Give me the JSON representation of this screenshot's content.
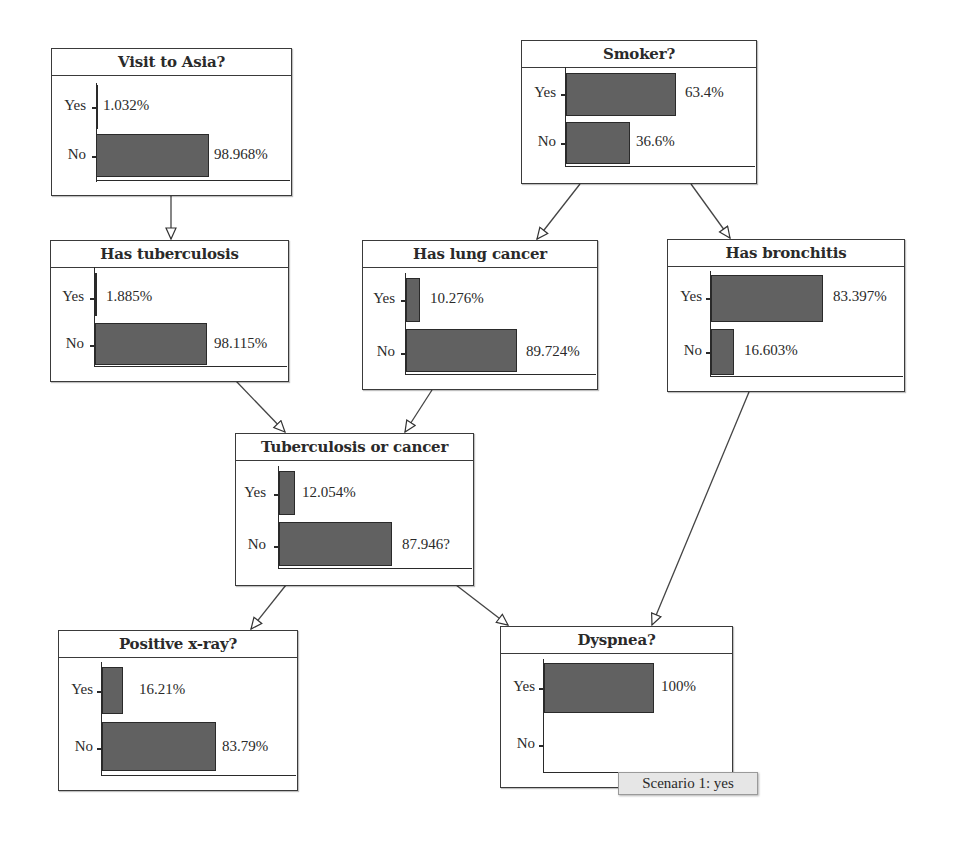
{
  "nodes": {
    "visit_asia": {
      "title": "Visit to Asia?",
      "states": [
        {
          "label": "Yes",
          "value": "1.032%"
        },
        {
          "label": "No",
          "value": "98.968%"
        }
      ]
    },
    "smoker": {
      "title": "Smoker?",
      "states": [
        {
          "label": "Yes",
          "value": "63.4%"
        },
        {
          "label": "No",
          "value": "36.6%"
        }
      ]
    },
    "tuberculosis": {
      "title": "Has tuberculosis",
      "states": [
        {
          "label": "Yes",
          "value": "1.885%"
        },
        {
          "label": "No",
          "value": "98.115%"
        }
      ]
    },
    "lung_cancer": {
      "title": "Has lung cancer",
      "states": [
        {
          "label": "Yes",
          "value": "10.276%"
        },
        {
          "label": "No",
          "value": "89.724%"
        }
      ]
    },
    "bronchitis": {
      "title": "Has bronchitis",
      "states": [
        {
          "label": "Yes",
          "value": "83.397%"
        },
        {
          "label": "No",
          "value": "16.603%"
        }
      ]
    },
    "tb_or_cancer": {
      "title": "Tuberculosis or cancer",
      "states": [
        {
          "label": "Yes",
          "value": "12.054%"
        },
        {
          "label": "No",
          "value": "87.946?"
        }
      ]
    },
    "xray": {
      "title": "Positive x-ray?",
      "states": [
        {
          "label": "Yes",
          "value": "16.21%"
        },
        {
          "label": "No",
          "value": "83.79%"
        }
      ]
    },
    "dyspnea": {
      "title": "Dyspnea?",
      "states": [
        {
          "label": "Yes",
          "value": "100%"
        },
        {
          "label": "No",
          "value": ""
        }
      ],
      "scenario_label": "Scenario 1: yes"
    }
  },
  "edges": [
    {
      "from": "Visit to Asia?",
      "to": "Has tuberculosis"
    },
    {
      "from": "Smoker?",
      "to": "Has lung cancer"
    },
    {
      "from": "Smoker?",
      "to": "Has bronchitis"
    },
    {
      "from": "Has tuberculosis",
      "to": "Tuberculosis or cancer"
    },
    {
      "from": "Has lung cancer",
      "to": "Tuberculosis or cancer"
    },
    {
      "from": "Tuberculosis or cancer",
      "to": "Positive x-ray?"
    },
    {
      "from": "Tuberculosis or cancer",
      "to": "Dyspnea?"
    },
    {
      "from": "Has bronchitis",
      "to": "Dyspnea?"
    }
  ],
  "colors": {
    "bar_fill": "#616161",
    "border": "#3a3a3a",
    "scenario_bg": "#e6e6e6"
  }
}
